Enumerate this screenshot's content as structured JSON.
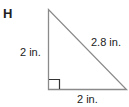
{
  "figure": {
    "label": "H",
    "shape": "right-triangle",
    "sides": {
      "vertical_leg": "2 in.",
      "hypotenuse": "2.8 in.",
      "horizontal_leg": "2 in."
    },
    "right_angle_marker": true,
    "stroke_color": "#8a8a8a",
    "marker_color": "#333333"
  }
}
